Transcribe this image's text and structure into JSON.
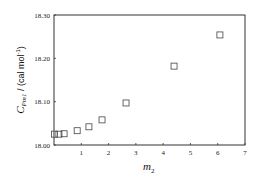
{
  "chart_data": {
    "type": "scatter",
    "title": "",
    "xlabel": "m",
    "xlabel_subscript": "2",
    "ylabel_main": "C",
    "ylabel_subscript": "Pm1",
    "ylabel_units": " / (cal mol",
    "ylabel_units_sup": "-1",
    "ylabel_units_close": ")",
    "xlim": [
      0,
      7
    ],
    "ylim": [
      18.0,
      18.3
    ],
    "x_ticks": [
      1,
      2,
      3,
      4,
      5,
      6,
      7
    ],
    "x_tick_labels": [
      "1",
      "2",
      "3",
      "4",
      "5",
      "6",
      "7"
    ],
    "y_ticks": [
      18.0,
      18.1,
      18.2,
      18.3
    ],
    "y_tick_labels": [
      "18.00",
      "18.10",
      "18.20",
      "18.30"
    ],
    "grid": false,
    "legend": null,
    "marker": "open-square",
    "series": [
      {
        "name": "data",
        "x": [
          0.02,
          0.18,
          0.37,
          0.85,
          1.28,
          1.76,
          2.64,
          4.4,
          6.08
        ],
        "y": [
          18.025,
          18.025,
          18.026,
          18.033,
          18.042,
          18.058,
          18.097,
          18.182,
          18.254
        ]
      }
    ]
  }
}
